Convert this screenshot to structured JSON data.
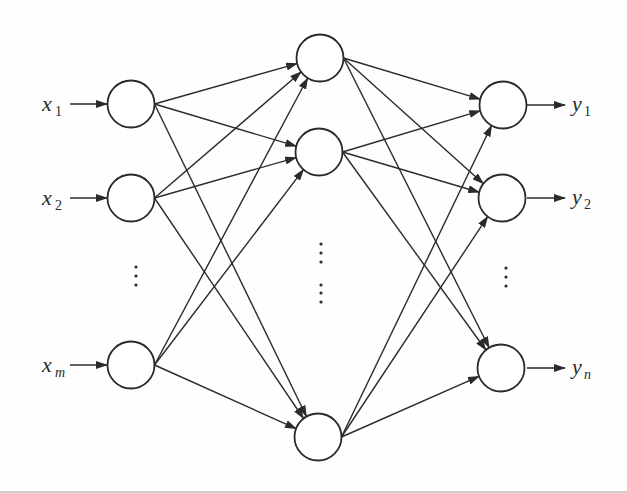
{
  "diagram": {
    "colors": {
      "stroke": "#2b2b2b",
      "node_fill": "#ffffff",
      "background": "#fefefe"
    },
    "node_radius": 23.5,
    "layers": [
      {
        "name": "input",
        "nodes": [
          {
            "id": "x1",
            "cx": 131,
            "cy": 104,
            "label": "x",
            "sub": "1",
            "sub_italic": false
          },
          {
            "id": "x2",
            "cx": 131,
            "cy": 198,
            "label": "x",
            "sub": "2",
            "sub_italic": false
          },
          {
            "id": "xm",
            "cx": 131,
            "cy": 365,
            "label": "x",
            "sub": "m",
            "sub_italic": true
          }
        ],
        "ellipsis": [
          {
            "x": 136,
            "y": [
              267,
              276,
              285
            ]
          }
        ]
      },
      {
        "name": "hidden",
        "nodes": [
          {
            "id": "h1",
            "cx": 320,
            "cy": 58
          },
          {
            "id": "h2",
            "cx": 319,
            "cy": 152
          },
          {
            "id": "hk",
            "cx": 318,
            "cy": 437
          }
        ],
        "ellipsis": [
          {
            "x": 321,
            "y": [
              244,
              253,
              262
            ]
          },
          {
            "x": 321,
            "y": [
              285,
              293,
              302
            ]
          }
        ]
      },
      {
        "name": "output",
        "nodes": [
          {
            "id": "y1",
            "cx": 503,
            "cy": 105,
            "label": "y",
            "sub": "1",
            "sub_italic": false
          },
          {
            "id": "y2",
            "cx": 502,
            "cy": 198,
            "label": "y",
            "sub": "2",
            "sub_italic": false
          },
          {
            "id": "yn",
            "cx": 501,
            "cy": 368,
            "label": "y",
            "sub": "n",
            "sub_italic": true
          }
        ],
        "ellipsis": [
          {
            "x": 506,
            "y": [
              268,
              277,
              286
            ]
          }
        ]
      }
    ],
    "input_arrow": {
      "from_x": 70,
      "to_x": 107
    },
    "output_arrow": {
      "from_x": 527,
      "to_x": 565
    },
    "input_label_x": 42,
    "output_label_x": 572
  }
}
